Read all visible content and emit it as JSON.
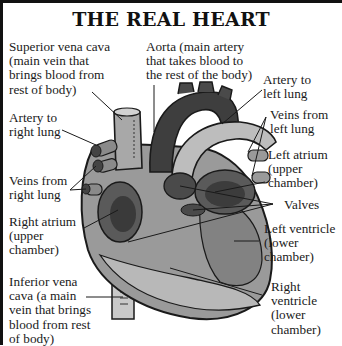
{
  "title": "THE REAL HEART",
  "colors": {
    "ink": "#1a1a1a",
    "heart_dark": "#3a3a3a",
    "heart_mid": "#7a7a7a",
    "heart_light": "#b5b5b5",
    "border": "#111111"
  },
  "labels": {
    "superior_vena_cava": "Superior vena cava\n(main vein that\nbrings blood from\nrest of body)",
    "aorta": "Aorta (main artery\nthat takes blood to\nthe rest of the body)",
    "artery_left_lung": "Artery to\nleft lung",
    "artery_right_lung": "Artery to\nright lung",
    "veins_left_lung": "Veins from\nleft lung",
    "left_atrium": "Left atrium\n(upper\nchamber)",
    "veins_right_lung": "Veins from\nright lung",
    "valves": "Valves",
    "right_atrium": "Right atrium\n(upper\nchamber)",
    "left_ventricle": "Left ventricle\n(lower\nchamber)",
    "inferior_vena_cava": "Inferior vena\ncava (a main\nvein that brings\nblood from rest\nof body)",
    "right_ventricle": "Right\nventricle\n(lower\nchamber)"
  }
}
